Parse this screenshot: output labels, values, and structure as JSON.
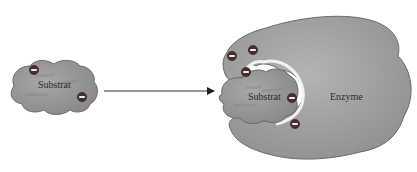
{
  "diagram": {
    "type": "enzyme-substrate-binding",
    "left": {
      "substrate_label": "Substrat",
      "charges": [
        "-",
        "-"
      ]
    },
    "arrow": {
      "direction": "right"
    },
    "right": {
      "substrate_label": "Substrat",
      "enzyme_label": "Enzyme",
      "charges_on_enzyme": [
        "-",
        "-",
        "-"
      ],
      "charges_on_substrate": [
        "-",
        "-"
      ]
    },
    "colors": {
      "shape_fill": "#9a9a9a",
      "shape_stroke": "#6a6a6a",
      "charge_fill": "#4a2e2e",
      "charge_symbol": "#ffffff",
      "arrow": "#333333",
      "gap_highlight": "#f2f2f2"
    }
  }
}
